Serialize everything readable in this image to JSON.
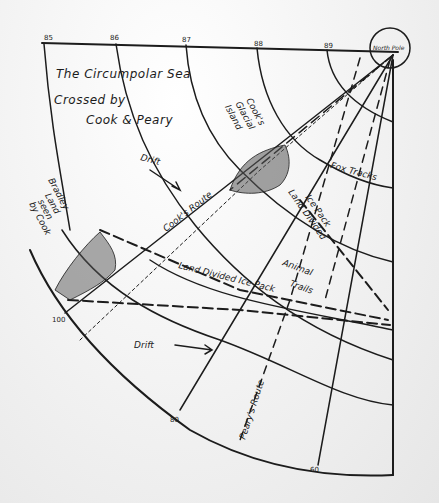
{
  "map": {
    "title_lines": [
      "The Circumpolar Sea",
      "Crossed by",
      "Cook & Peary"
    ],
    "north_pole_label": "North Pole",
    "top_ticks": [
      "85",
      "86",
      "87",
      "88",
      "89"
    ],
    "bottom_ticks": [
      "100",
      "80",
      "60"
    ],
    "labels": {
      "cooks_glacial_island": [
        "Cook's",
        "Glacial",
        "Island"
      ],
      "bradley_land": [
        "Bradley",
        "Land",
        "seen",
        "by Cook"
      ],
      "fox_tracks": "Fox Tracks",
      "land_divided_ice_pack_1": [
        "Land Divided",
        "Ice Pack"
      ],
      "animal_trails": [
        "Animal",
        "Trails"
      ],
      "land_divided_ice_pack_2": "Land Divided Ice Pack",
      "cooks_route": "Cook's Route",
      "pearys_route": "Peary's Route",
      "drift_upper": "Drift",
      "drift_lower": "Drift"
    },
    "colors": {
      "ink": "#1c1c1c",
      "paper": "#f2f2f2"
    }
  }
}
